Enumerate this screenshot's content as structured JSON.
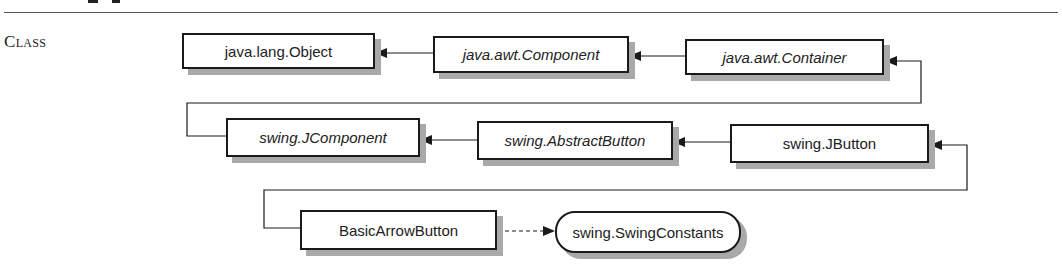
{
  "section": {
    "label": "Class"
  },
  "diagram": {
    "nodes": [
      {
        "id": "object",
        "label": "java.lang.Object",
        "kind": "class",
        "italic": false
      },
      {
        "id": "component",
        "label": "java.awt.Component",
        "kind": "abstract-class",
        "italic": true
      },
      {
        "id": "container",
        "label": "java.awt.Container",
        "kind": "class",
        "italic": true
      },
      {
        "id": "jcomponent",
        "label": "swing.JComponent",
        "kind": "abstract-class",
        "italic": true
      },
      {
        "id": "abstractbutton",
        "label": "swing.AbstractButton",
        "kind": "abstract-class",
        "italic": true
      },
      {
        "id": "jbutton",
        "label": "swing.JButton",
        "kind": "class",
        "italic": false
      },
      {
        "id": "basicarrowbutton",
        "label": "BasicArrowButton",
        "kind": "class",
        "italic": false
      },
      {
        "id": "swingconstants",
        "label": "swing.SwingConstants",
        "kind": "interface",
        "italic": false
      }
    ],
    "edges": [
      {
        "from": "component",
        "to": "object",
        "type": "extends"
      },
      {
        "from": "container",
        "to": "component",
        "type": "extends"
      },
      {
        "from": "jcomponent",
        "to": "container",
        "type": "extends"
      },
      {
        "from": "abstractbutton",
        "to": "jcomponent",
        "type": "extends"
      },
      {
        "from": "jbutton",
        "to": "abstractbutton",
        "type": "extends"
      },
      {
        "from": "basicarrowbutton",
        "to": "jbutton",
        "type": "extends"
      },
      {
        "from": "basicarrowbutton",
        "to": "swingconstants",
        "type": "implements"
      }
    ],
    "colors": {
      "line": "#1a1a1a",
      "shadow": "#a9a9a9",
      "box_fill": "#ffffff"
    }
  }
}
